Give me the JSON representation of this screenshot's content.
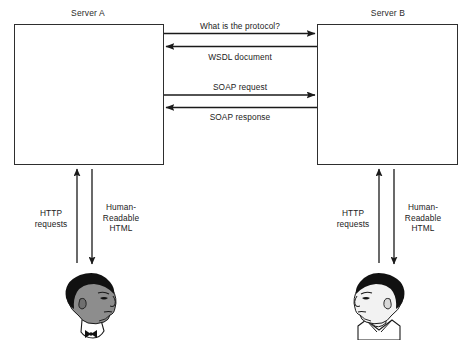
{
  "diagram": {
    "title_left": "Server A",
    "title_right": "Server B",
    "servers": [
      {
        "id": "server-a",
        "label": "Server A"
      },
      {
        "id": "server-b",
        "label": "Server B"
      }
    ],
    "messages": [
      {
        "id": "msg-1",
        "label": "What is the protocol?",
        "direction": "left-to-right"
      },
      {
        "id": "msg-2",
        "label": "WSDL document",
        "direction": "right-to-left"
      },
      {
        "id": "msg-3",
        "label": "SOAP request",
        "direction": "left-to-right"
      },
      {
        "id": "msg-4",
        "label": "SOAP response",
        "direction": "right-to-left"
      }
    ],
    "client_flows": {
      "left": {
        "up_label_line1": "HTTP",
        "up_label_line2": "requests",
        "down_label_line1": "Human-",
        "down_label_line2": "Readable",
        "down_label_line3": "HTML"
      },
      "right": {
        "up_label_line1": "HTTP",
        "up_label_line2": "requests",
        "down_label_line1": "Human-",
        "down_label_line2": "Readable",
        "down_label_line3": "HTML"
      }
    },
    "people": [
      {
        "id": "person-left",
        "facing": "right"
      },
      {
        "id": "person-right",
        "facing": "left"
      }
    ],
    "colors": {
      "stroke": "#2e2e2e",
      "arrow": "#1a1a1a",
      "background": "#ffffff",
      "hair": "#111111",
      "skin_left": "#8d8d8d",
      "skin_right": "#f2f2f2"
    }
  }
}
